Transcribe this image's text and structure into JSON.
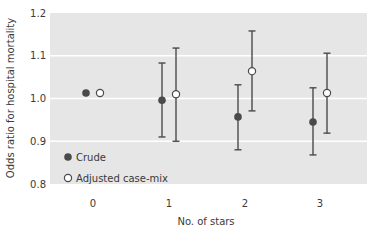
{
  "chart_data": {
    "type": "scatter",
    "subtype": "point-with-error-bars",
    "title": "",
    "xlabel": "No. of stars",
    "ylabel": "Odds ratio for hospital mortality",
    "categories": [
      "0",
      "1",
      "2",
      "3"
    ],
    "ylim": [
      0.8,
      1.2
    ],
    "yticks": [
      "0.8",
      "0.9",
      "1.0",
      "1.1",
      "1.2"
    ],
    "grid": true,
    "legend_position": "lower-left inside",
    "series": [
      {
        "name": "Crude",
        "marker": "filled-circle",
        "color": "#4a4a4a",
        "values": [
          1.013,
          0.996,
          0.957,
          0.945
        ],
        "lower": [
          null,
          0.91,
          0.88,
          0.868
        ],
        "upper": [
          null,
          1.083,
          1.032,
          1.025
        ]
      },
      {
        "name": "Adjusted case-mix",
        "marker": "open-circle",
        "color": "#4a4a4a",
        "values": [
          1.013,
          1.01,
          1.064,
          1.013
        ],
        "lower": [
          null,
          0.9,
          0.971,
          0.919
        ],
        "upper": [
          null,
          1.118,
          1.158,
          1.106
        ]
      }
    ]
  },
  "colors": {
    "plot_bg": "#e6e6e6",
    "grid": "#ffffff",
    "marker": "#4a4a4a"
  }
}
